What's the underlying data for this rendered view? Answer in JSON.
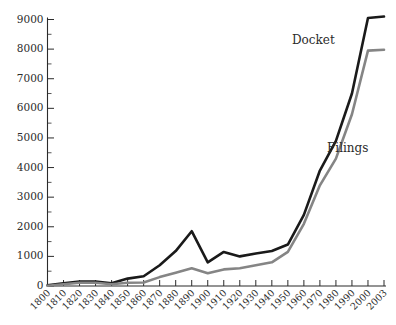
{
  "chart_data": {
    "type": "line",
    "title": "",
    "subtitle": "",
    "xlabel": "",
    "ylabel": "",
    "xlim": [
      1800,
      2003
    ],
    "ylim": [
      0,
      9000
    ],
    "grid": false,
    "legend_position": "inline-right",
    "x": [
      1800,
      1810,
      1820,
      1830,
      1840,
      1850,
      1860,
      1870,
      1880,
      1890,
      1900,
      1910,
      1920,
      1930,
      1940,
      1950,
      1960,
      1970,
      1980,
      1990,
      2000,
      2003
    ],
    "x_tick_labels": [
      "1800",
      "1810",
      "1820",
      "1830",
      "1840",
      "1850",
      "1860",
      "1870",
      "1880",
      "1890",
      "1900",
      "1910",
      "1920",
      "1930",
      "1940",
      "1950",
      "1960",
      "1970",
      "1980",
      "1990",
      "2000",
      "2003"
    ],
    "y_tick_labels": [
      "0",
      "1000",
      "2000",
      "3000",
      "4000",
      "5000",
      "6000",
      "7000",
      "8000",
      "9000"
    ],
    "y_ticks": [
      0,
      1000,
      2000,
      3000,
      4000,
      5000,
      6000,
      7000,
      8000,
      9000
    ],
    "y_minor_step": 500,
    "series": [
      {
        "name": "Docket",
        "color": "#1a1a1a",
        "label": "Docket",
        "values": [
          20,
          90,
          150,
          150,
          90,
          250,
          330,
          700,
          1180,
          1850,
          800,
          1150,
          1000,
          1100,
          1180,
          1400,
          2400,
          3900,
          4900,
          6500,
          9050,
          9100
        ]
      },
      {
        "name": "Filings",
        "color": "#858585",
        "label": "Filings",
        "values": [
          10,
          60,
          110,
          110,
          60,
          110,
          120,
          300,
          450,
          600,
          430,
          560,
          600,
          700,
          800,
          1150,
          2100,
          3400,
          4300,
          5800,
          7950,
          7980
        ]
      }
    ],
    "annotations": [
      {
        "text": "Docket",
        "series": "Docket"
      },
      {
        "text": "Filings",
        "series": "Filings"
      }
    ]
  }
}
